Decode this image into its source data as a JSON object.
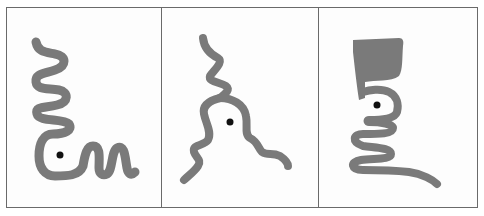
{
  "figure": {
    "stroke_color": "#7a7a7a",
    "dot_color": "#111111",
    "border_color": "#6a6a6a",
    "background_color": "#fdfdfd",
    "panels": [
      {
        "index": 1,
        "shape": "serpentine-coil-with-m-tail",
        "has_dot": true
      },
      {
        "index": 2,
        "shape": "three-armed-branching-wavy",
        "has_dot": true
      },
      {
        "index": 3,
        "shape": "cup-topped-serpentine",
        "has_dot": true
      }
    ]
  }
}
